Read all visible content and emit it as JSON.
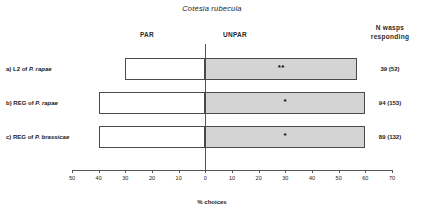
{
  "chart_data": {
    "type": "bar",
    "title": "Cotesia rubecula",
    "xlabel": "% choices",
    "ylabel": "",
    "orientation": "horizontal-diverging",
    "grid": false,
    "legend_position": "top",
    "xlim": [
      -50,
      70
    ],
    "zero_at": 0,
    "tick_values": [
      -50,
      -40,
      -30,
      -20,
      -10,
      0,
      10,
      20,
      30,
      40,
      50,
      60,
      70
    ],
    "tick_labels": [
      "50",
      "40",
      "30",
      "20",
      "10",
      "0",
      "10",
      "20",
      "30",
      "40",
      "50",
      "60",
      "70"
    ],
    "side_labels": {
      "left": "PAR",
      "right": "UNPAR"
    },
    "right_column_header": "N wasps responding",
    "categories": [
      "a) L2 of P. rapae",
      "b) REG of P. rapae",
      "c) REG of P. brassicae"
    ],
    "series": [
      {
        "name": "PAR",
        "values": [
          -30,
          -40,
          -40
        ]
      },
      {
        "name": "UNPAR",
        "values": [
          57,
          60,
          60
        ]
      }
    ],
    "annotations": [
      "**",
      "*",
      "*"
    ],
    "n_responding": [
      "39 (52)",
      "94 (153)",
      "89 (132)"
    ],
    "colors": {
      "par_fill": "#ffffff",
      "unpar_fill": "#d4d4d4",
      "bar_stroke": "#4a4a4a",
      "axis": "#555555"
    }
  },
  "header": {
    "title": "Cotesia rubecula",
    "par_label": "PAR",
    "unpar_label": "UNPAR",
    "n_label_line1": "N wasps",
    "n_label_line2": "responding"
  },
  "rows": [
    {
      "prefix": "a) L2 of ",
      "species": "P. rapae",
      "n": "39 (52)",
      "sig": "**"
    },
    {
      "prefix": "b) REG of ",
      "species": "P. rapae",
      "n": "94 (153)",
      "sig": "*"
    },
    {
      "prefix": "c) REG of ",
      "species": "P. brassicae",
      "n": "89 (132)",
      "sig": "*"
    }
  ],
  "axis": {
    "title": "% choices",
    "ticks": [
      "50",
      "40",
      "30",
      "20",
      "10",
      "0",
      "10",
      "20",
      "30",
      "40",
      "50",
      "60",
      "70"
    ]
  }
}
